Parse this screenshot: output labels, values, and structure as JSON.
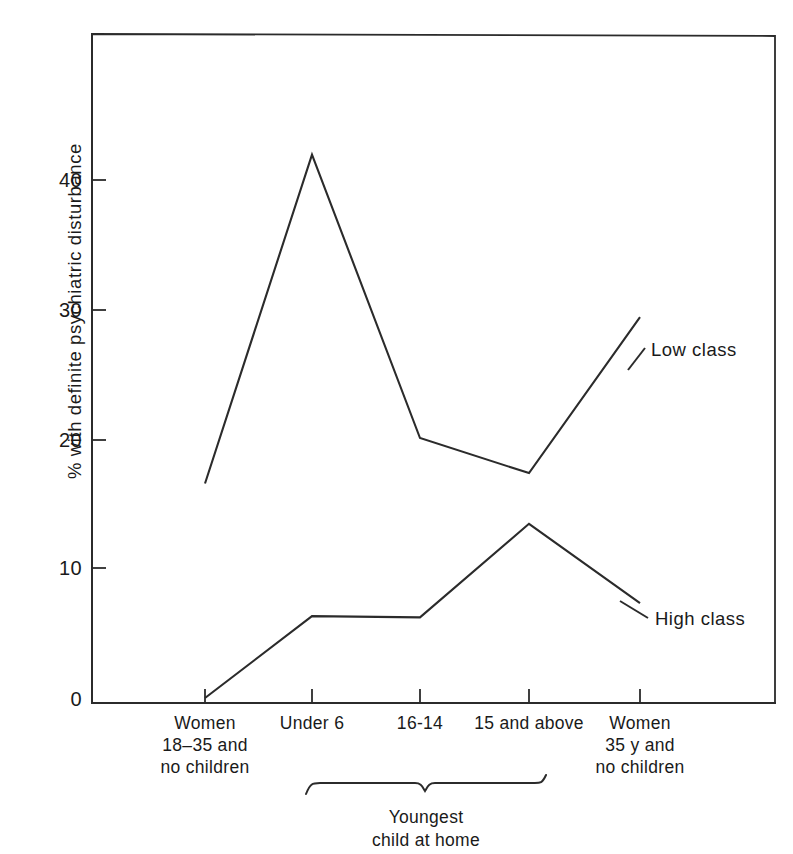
{
  "figure": {
    "background_color": "#ffffff",
    "ink_color": "#2b2b2b"
  },
  "axes": {
    "y_axis_title": "% with definite psychiatric disturbance",
    "y_ticks": [
      "40",
      "30",
      "20",
      "10",
      "0"
    ],
    "x_group_caption_line1": "Youngest",
    "x_group_caption_line2": "child at home"
  },
  "x_categories": [
    {
      "line1": "Women",
      "line2": "18–35 and",
      "line3": "no children"
    },
    {
      "line1": "Under 6",
      "line2": "",
      "line3": ""
    },
    {
      "line1": "16-14",
      "line2": "",
      "line3": ""
    },
    {
      "line1": "15 and above",
      "line2": "",
      "line3": ""
    },
    {
      "line1": "Women",
      "line2": "35 y and",
      "line3": "no children"
    }
  ],
  "series_labels": {
    "low": "Low class",
    "high": "High class"
  },
  "chart_data": {
    "type": "line",
    "title": "",
    "xlabel": "Youngest child at home",
    "ylabel": "% with definite psychiatric disturbance",
    "ylim": [
      0,
      48
    ],
    "y_ticks": [
      0,
      10,
      20,
      30,
      40
    ],
    "grid": false,
    "legend": "inline-right-of-line-ends",
    "categories": [
      "Women 18-35 and no children",
      "Under 6",
      "16-14",
      "15 and above",
      "Women 35 y and no children"
    ],
    "series": [
      {
        "name": "Low class",
        "values": [
          16.5,
          41.8,
          20.0,
          17.3,
          29.3
        ]
      },
      {
        "name": "High class",
        "values": [
          0.0,
          6.3,
          6.2,
          13.4,
          7.3
        ]
      }
    ],
    "annotations": [
      "Bracket under categories 2-4 labelled 'Youngest child at home'"
    ]
  }
}
